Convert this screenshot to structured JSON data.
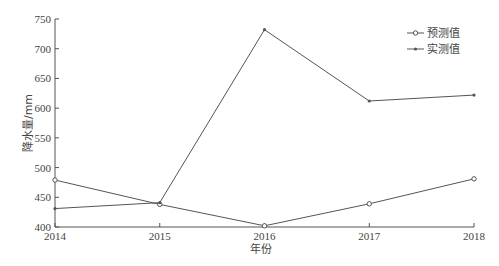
{
  "chart_data": {
    "type": "line",
    "title": "",
    "xlabel": "年份",
    "ylabel": "降水量/mm",
    "categories": [
      "2014",
      "2015",
      "2016",
      "2017",
      "2018"
    ],
    "series": [
      {
        "name": "预测值",
        "marker": "open-circle",
        "values": [
          479,
          438,
          402,
          439,
          481
        ]
      },
      {
        "name": "实测值",
        "marker": "filled-dot",
        "values": [
          431,
          441,
          732,
          612,
          622
        ]
      }
    ],
    "yticks": [
      400,
      450,
      500,
      550,
      600,
      650,
      700,
      750
    ],
    "ylim": [
      400,
      750
    ],
    "grid": false,
    "legend_position": "upper-right"
  },
  "colors": {
    "line": "#555555",
    "axis": "#555555",
    "text": "#444444"
  }
}
